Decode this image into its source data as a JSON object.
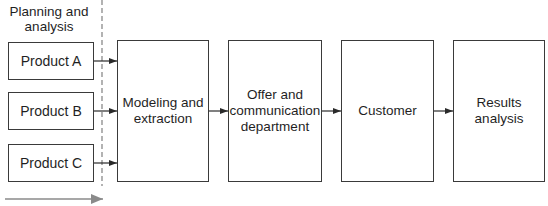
{
  "diagram": {
    "phase_label": "Planning and\nanalysis",
    "products": [
      {
        "label": "Product A"
      },
      {
        "label": "Product B"
      },
      {
        "label": "Product C"
      }
    ],
    "stages": [
      {
        "label": "Modeling and\nextraction"
      },
      {
        "label": "Offer and\ncommunication\ndepartment"
      },
      {
        "label": "Customer"
      },
      {
        "label": "Results\nanalysis"
      }
    ],
    "colors": {
      "stroke": "#3a3a3a",
      "dashed_line": "#8a8a8a",
      "timeline_arrow": "#8a8a8a"
    }
  }
}
